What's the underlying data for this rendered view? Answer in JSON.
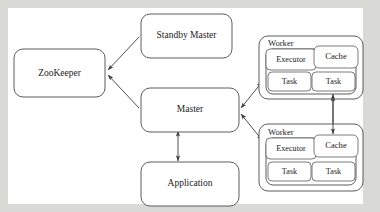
{
  "diagram": {
    "type": "block-diagram",
    "background_color": "#d9d9d6",
    "canvas_color": "#ffffff",
    "stroke_color": "#3c3c3c",
    "nodes": {
      "zookeeper": {
        "label": "ZooKeeper"
      },
      "standby_master": {
        "label": "Standby Master"
      },
      "master": {
        "label": "Master"
      },
      "application": {
        "label": "Application"
      },
      "worker_top": {
        "label": "Worker",
        "executor": "Executor",
        "cache": "Cache",
        "task_left": "Task",
        "task_right": "Task"
      },
      "worker_bottom": {
        "label": "Worker",
        "executor": "Executor",
        "cache": "Cache",
        "task_left": "Task",
        "task_right": "Task"
      }
    },
    "edges": [
      {
        "from": "standby_master",
        "to": "zookeeper",
        "arrows": "single"
      },
      {
        "from": "master",
        "to": "zookeeper",
        "arrows": "single"
      },
      {
        "from": "master",
        "to": "application",
        "arrows": "double"
      },
      {
        "from": "master",
        "to": "worker_top",
        "arrows": "double"
      },
      {
        "from": "master",
        "to": "worker_bottom",
        "arrows": "double"
      },
      {
        "from": "worker_top_cache",
        "to": "worker_bottom_cache",
        "arrows": "double"
      }
    ]
  }
}
